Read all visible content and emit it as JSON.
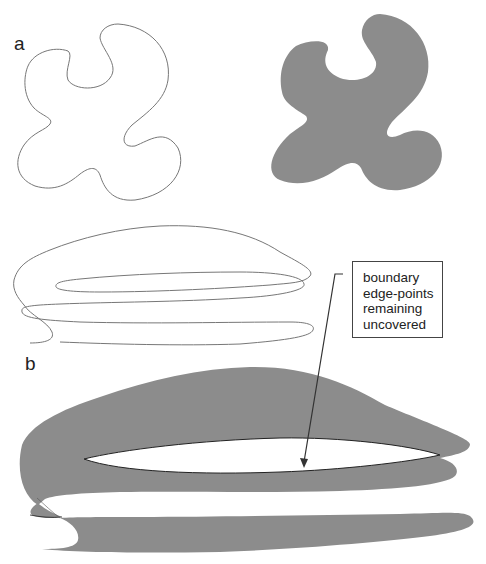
{
  "figure": {
    "panel_a": {
      "label": "a",
      "left_shape": "outline contour of a four-lobed blob",
      "right_shape": "filled region of the same blob"
    },
    "panel_b": {
      "label": "b",
      "top_shape": "self-intersecting spiral-like outline curve",
      "bottom_shape": "filled region of the spiral curve with uncovered white gaps"
    },
    "callout": {
      "lines": [
        "boundary",
        "edge-points",
        "remaining",
        "uncovered"
      ]
    },
    "colors": {
      "fill": "#8c8c8c",
      "outline": "#777777",
      "arrow": "#333333",
      "background": "#ffffff"
    }
  }
}
